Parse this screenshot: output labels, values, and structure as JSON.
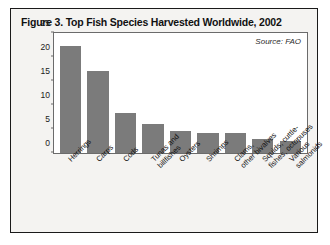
{
  "figure": {
    "title": "Figure 3. Top Fish Species Harvested Worldwide, 2002",
    "source_note": "Source: FAO"
  },
  "chart_data": {
    "type": "bar",
    "title": "Figure 3. Top Fish Species Harvested Worldwide, 2002",
    "xlabel": "",
    "ylabel": "Million Tons",
    "ylim": [
      0,
      25
    ],
    "yticks": [
      0,
      5,
      10,
      15,
      20,
      25
    ],
    "grid": false,
    "legend": false,
    "annotations": [
      "Source: FAO"
    ],
    "bar_color": "#7b7b7b",
    "categories": [
      "Herrings",
      "Carps",
      "Cods",
      "Tunas and billfishes",
      "Oysters",
      "Shrimps",
      "Clams, other bivalves",
      "Squids, cuttle-fishes, octopuses",
      "Various salmonids"
    ],
    "category_lines": [
      [
        "Herrings"
      ],
      [
        "Carps"
      ],
      [
        "Cods"
      ],
      [
        "Tunas and",
        "billfishes"
      ],
      [
        "Oysters"
      ],
      [
        "Shrimps"
      ],
      [
        "Clams,",
        "other bivalves"
      ],
      [
        "Squids, cuttle-",
        "fishes, octopuses"
      ],
      [
        "Various",
        "salmonids"
      ]
    ],
    "values": [
      22.2,
      17.1,
      8.3,
      6.0,
      4.5,
      4.2,
      4.2,
      3.0,
      2.4
    ]
  }
}
